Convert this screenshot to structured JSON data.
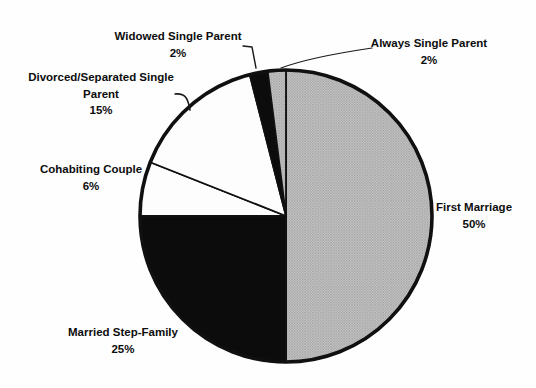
{
  "chart_data": {
    "type": "pie",
    "title": "",
    "categories": [
      "First Marriage",
      "Married Step-Family",
      "Cohabiting Couple",
      "Divorced/Separated Single Parent",
      "Widowed Single Parent",
      "Always Single Parent"
    ],
    "values": [
      50,
      25,
      6,
      15,
      2,
      2
    ],
    "slices": [
      {
        "label": "First Marriage",
        "pct_label": "50%",
        "value": 50,
        "fill": "halftone"
      },
      {
        "label": "Married Step-Family",
        "pct_label": "25%",
        "value": 25,
        "fill": "black"
      },
      {
        "label": "Cohabiting Couple",
        "pct_label": "6%",
        "value": 6,
        "fill": "white"
      },
      {
        "label": "Divorced/Separated Single Parent",
        "pct_label": "15%",
        "value": 15,
        "fill": "white"
      },
      {
        "label": "Widowed Single Parent",
        "pct_label": "2%",
        "value": 2,
        "fill": "black"
      },
      {
        "label": "Always Single Parent",
        "pct_label": "2%",
        "value": 2,
        "fill": "halftone"
      }
    ],
    "layout": {
      "start_angle_deg": 0,
      "direction": "clockwise",
      "center": [
        286,
        216
      ],
      "radius": 146,
      "legend": "none",
      "labels": "outside-with-leader-lines"
    },
    "colors": {
      "halftone_base": "#c6c6c6",
      "halftone_dot": "#8a8a8a",
      "black": "#0c0c0c",
      "white": "#fdfdfd",
      "outline": "#101010",
      "text": "#0d0d0d"
    }
  }
}
